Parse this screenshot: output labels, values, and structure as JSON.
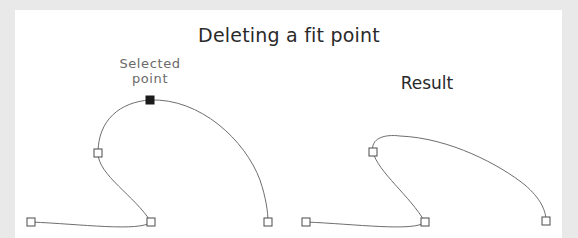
{
  "title": "Deleting a fit point",
  "labels": {
    "selected_line1": "Selected",
    "selected_line2": "point",
    "result": "Result"
  },
  "colors": {
    "background": "#e9e9e9",
    "panel": "#ffffff",
    "curve": "#6e6e6e",
    "fit_point": "#4a4a4a",
    "selected_point": "#1a1a1a",
    "title_text": "#2a2a2a",
    "label_text": "#6a6a6a"
  },
  "diagrams": [
    {
      "name": "before",
      "fit_points": [
        {
          "x": 31,
          "y": 222,
          "selected": false
        },
        {
          "x": 151,
          "y": 222,
          "selected": false
        },
        {
          "x": 98,
          "y": 153,
          "selected": false
        },
        {
          "x": 150,
          "y": 100,
          "selected": true
        },
        {
          "x": 268,
          "y": 222,
          "selected": false
        }
      ]
    },
    {
      "name": "result",
      "fit_points": [
        {
          "x": 306,
          "y": 222,
          "selected": false
        },
        {
          "x": 425,
          "y": 222,
          "selected": false
        },
        {
          "x": 373,
          "y": 152,
          "selected": false
        },
        {
          "x": 546,
          "y": 221,
          "selected": false
        }
      ]
    }
  ]
}
